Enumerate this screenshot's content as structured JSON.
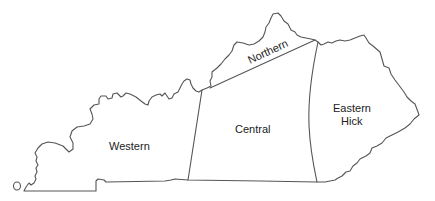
{
  "map": {
    "title": "",
    "regions": [
      {
        "id": "western",
        "label": "Western"
      },
      {
        "id": "central",
        "label": "Central"
      },
      {
        "id": "northern",
        "label": "Northern"
      },
      {
        "id": "eastern",
        "label_line1": "Eastern",
        "label_line2": "Hick"
      }
    ],
    "colors": {
      "fill": "#ffffff",
      "border": "#555555",
      "text": "#222222"
    }
  }
}
